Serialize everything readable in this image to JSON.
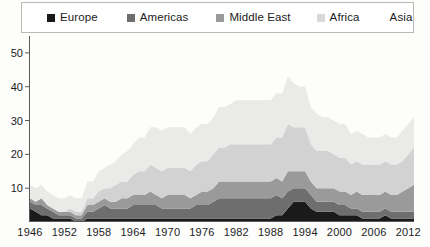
{
  "legend": {
    "position": "top",
    "entries": [
      {
        "label": "Europe",
        "color": "#1a1a1a",
        "has_swatch": true
      },
      {
        "label": "Americas",
        "color": "#6e6e6e",
        "has_swatch": true
      },
      {
        "label": "Middle East",
        "color": "#9a9a9a",
        "has_swatch": true
      },
      {
        "label": "Africa",
        "color": "#d2d2d2",
        "has_swatch": true
      },
      {
        "label": "Asia",
        "color": "#eaeae8",
        "has_swatch": false
      }
    ]
  },
  "axes": {
    "y_ticks": [
      "10",
      "20",
      "30",
      "40",
      "50"
    ],
    "x_ticks": [
      "1946",
      "1952",
      "1958",
      "1964",
      "1970",
      "1976",
      "1982",
      "1988",
      "1994",
      "2000",
      "2006",
      "2012"
    ]
  },
  "chart_data": {
    "type": "area",
    "stacked": true,
    "title": "",
    "subtitle": "",
    "xlabel": "",
    "ylabel": "",
    "grid": false,
    "legend_position": "top",
    "xlim": [
      1946,
      2013
    ],
    "ylim": [
      0,
      55
    ],
    "y_ticks": [
      10,
      20,
      30,
      40,
      50
    ],
    "x_ticks": [
      1946,
      1952,
      1958,
      1964,
      1970,
      1976,
      1982,
      1988,
      1994,
      2000,
      2006,
      2012
    ],
    "x": [
      1946,
      1947,
      1948,
      1949,
      1950,
      1951,
      1952,
      1953,
      1954,
      1955,
      1956,
      1957,
      1958,
      1959,
      1960,
      1961,
      1962,
      1963,
      1964,
      1965,
      1966,
      1967,
      1968,
      1969,
      1970,
      1971,
      1972,
      1973,
      1974,
      1975,
      1976,
      1977,
      1978,
      1979,
      1980,
      1981,
      1982,
      1983,
      1984,
      1985,
      1986,
      1987,
      1988,
      1989,
      1990,
      1991,
      1992,
      1993,
      1994,
      1995,
      1996,
      1997,
      1998,
      1999,
      2000,
      2001,
      2002,
      2003,
      2004,
      2005,
      2006,
      2007,
      2008,
      2009,
      2010,
      2011,
      2012,
      2013
    ],
    "series": [
      {
        "name": "Europe",
        "color": "#1a1a1a",
        "values": [
          4,
          3,
          2,
          2,
          1,
          1,
          1,
          1,
          0,
          0,
          1,
          1,
          1,
          1,
          1,
          1,
          1,
          1,
          1,
          1,
          1,
          1,
          1,
          1,
          1,
          1,
          1,
          1,
          1,
          1,
          1,
          1,
          1,
          1,
          1,
          1,
          1,
          1,
          1,
          1,
          1,
          1,
          1,
          2,
          2,
          4,
          6,
          6,
          6,
          4,
          3,
          3,
          3,
          3,
          2,
          2,
          2,
          2,
          1,
          1,
          1,
          1,
          2,
          1,
          1,
          1,
          1,
          1
        ]
      },
      {
        "name": "Americas",
        "color": "#6e6e6e",
        "values": [
          2,
          2,
          3,
          2,
          2,
          1,
          1,
          1,
          1,
          1,
          2,
          2,
          3,
          4,
          3,
          3,
          3,
          3,
          4,
          4,
          4,
          4,
          4,
          3,
          3,
          3,
          3,
          3,
          3,
          4,
          4,
          4,
          5,
          6,
          6,
          6,
          6,
          6,
          6,
          6,
          6,
          6,
          6,
          6,
          5,
          5,
          4,
          4,
          4,
          4,
          3,
          3,
          3,
          3,
          3,
          3,
          2,
          2,
          2,
          2,
          2,
          2,
          2,
          2,
          2,
          2,
          2,
          2
        ]
      },
      {
        "name": "Middle East",
        "color": "#9a9a9a",
        "values": [
          1,
          1,
          2,
          1,
          1,
          1,
          1,
          1,
          1,
          1,
          2,
          2,
          2,
          2,
          2,
          2,
          3,
          3,
          3,
          3,
          3,
          4,
          3,
          3,
          4,
          4,
          4,
          4,
          3,
          3,
          4,
          4,
          4,
          5,
          5,
          5,
          5,
          5,
          5,
          5,
          5,
          5,
          5,
          5,
          5,
          6,
          5,
          5,
          5,
          4,
          4,
          4,
          4,
          4,
          4,
          4,
          4,
          5,
          5,
          5,
          5,
          5,
          5,
          5,
          5,
          6,
          7,
          8
        ]
      },
      {
        "name": "Africa",
        "color": "#d2d2d2",
        "values": [
          0,
          0,
          0,
          0,
          0,
          0,
          0,
          1,
          1,
          1,
          2,
          2,
          3,
          3,
          4,
          5,
          5,
          5,
          6,
          7,
          7,
          8,
          8,
          8,
          8,
          8,
          8,
          8,
          8,
          9,
          9,
          9,
          10,
          10,
          10,
          11,
          11,
          11,
          11,
          11,
          11,
          11,
          11,
          12,
          13,
          14,
          13,
          13,
          13,
          11,
          11,
          11,
          11,
          10,
          10,
          10,
          9,
          9,
          9,
          9,
          9,
          9,
          9,
          9,
          9,
          9,
          10,
          11
        ]
      },
      {
        "name": "Asia",
        "color": "#eaeae8",
        "values": [
          4,
          4,
          4,
          4,
          4,
          4,
          4,
          4,
          4,
          4,
          5,
          5,
          6,
          6,
          7,
          7,
          8,
          9,
          9,
          10,
          10,
          11,
          12,
          12,
          12,
          12,
          12,
          12,
          11,
          11,
          11,
          11,
          11,
          12,
          12,
          12,
          13,
          13,
          13,
          13,
          13,
          13,
          13,
          13,
          13,
          14,
          13,
          12,
          12,
          11,
          11,
          10,
          10,
          10,
          10,
          10,
          9,
          9,
          9,
          8,
          8,
          8,
          8,
          8,
          8,
          9,
          9,
          9
        ]
      }
    ]
  }
}
